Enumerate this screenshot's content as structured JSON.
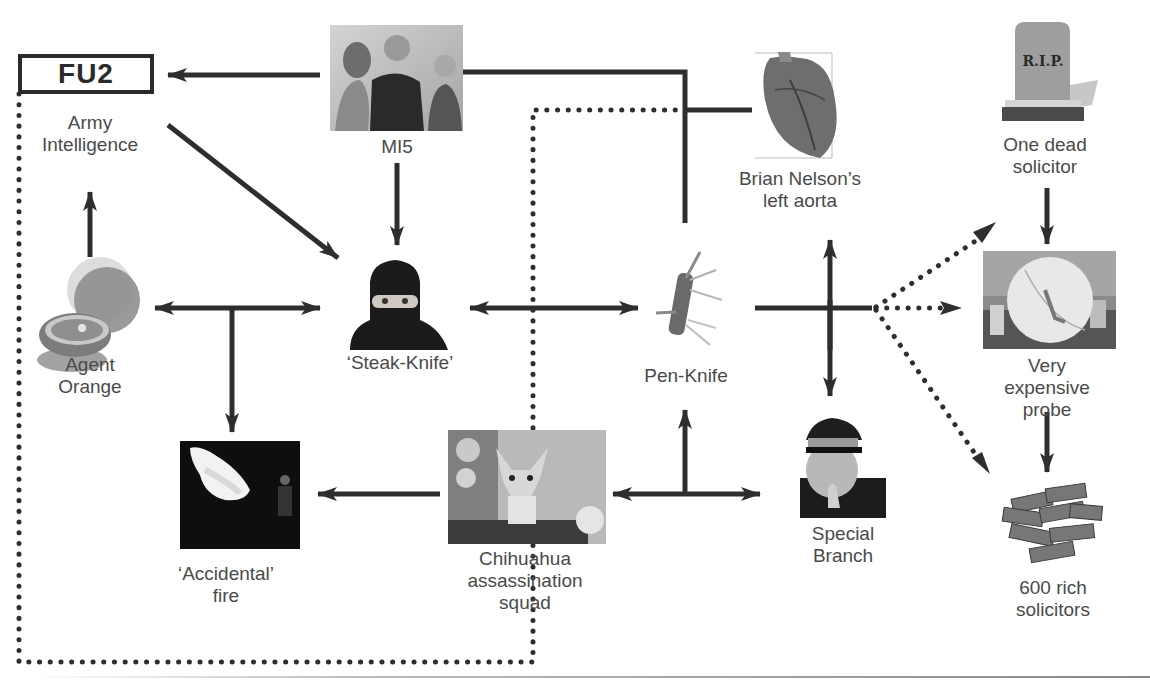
{
  "diagram": {
    "header_box": {
      "text": "FU2"
    },
    "nodes": [
      {
        "id": "fu2",
        "label": "Army\nIntelligence",
        "x": 90,
        "y": 112,
        "icon": "fu2-box"
      },
      {
        "id": "mi5",
        "label": "MI5",
        "x": 400,
        "y": 136,
        "icon": "photo-group-icon"
      },
      {
        "id": "aorta",
        "label": "Brian Nelson’s\nleft aorta",
        "x": 800,
        "y": 171,
        "icon": "heart-icon"
      },
      {
        "id": "dead",
        "label": "One dead\nsolicitor",
        "x": 1045,
        "y": 136,
        "icon": "gravestone-icon"
      },
      {
        "id": "orange",
        "label": "Agent\nOrange",
        "x": 90,
        "y": 356,
        "icon": "orange-icon"
      },
      {
        "id": "steak",
        "label": "‘Steak-Knife’",
        "x": 402,
        "y": 355,
        "icon": "balaclava-icon"
      },
      {
        "id": "pen",
        "label": "Pen-Knife",
        "x": 686,
        "y": 367,
        "icon": "pen-knife-icon"
      },
      {
        "id": "probe",
        "label": "Very expensive\nprobe",
        "x": 1047,
        "y": 356,
        "icon": "satellite-dish-icon"
      },
      {
        "id": "fire",
        "label": "‘Accidental’\nfire",
        "x": 226,
        "y": 565,
        "icon": "flame-icon"
      },
      {
        "id": "chihuahua",
        "label": "Chihuahua\nassassination\nsquad",
        "x": 513,
        "y": 547,
        "icon": "dog-icon"
      },
      {
        "id": "branch",
        "label": "Special\nBranch",
        "x": 843,
        "y": 525,
        "icon": "police-officer-icon"
      },
      {
        "id": "rich",
        "label": "600 rich\nsolicitors",
        "x": 1053,
        "y": 577,
        "icon": "cash-stack-icon"
      }
    ],
    "images": {
      "rip_text": "R.I.P."
    },
    "edges": [
      {
        "from": "mi5",
        "to": "fu2",
        "style": "solid",
        "arrow": "end"
      },
      {
        "from": "fu2",
        "to": "steak",
        "style": "solid",
        "arrow": "end"
      },
      {
        "from": "mi5",
        "to": "steak",
        "style": "solid",
        "arrow": "end"
      },
      {
        "from": "orange",
        "to": "fu2",
        "style": "solid",
        "arrow": "end"
      },
      {
        "from": "orange",
        "to": "steak",
        "style": "solid",
        "arrow": "both"
      },
      {
        "from": "orange-steak-junction",
        "to": "fire",
        "style": "solid",
        "arrow": "end"
      },
      {
        "from": "steak",
        "to": "pen",
        "style": "solid",
        "arrow": "both"
      },
      {
        "from": "mi5",
        "to": "pen",
        "style": "solid",
        "arrow": "none"
      },
      {
        "from": "aorta",
        "to": "mi5-pen-line",
        "style": "solid",
        "arrow": "none"
      },
      {
        "from": "branch-aorta-line",
        "to": "aorta",
        "style": "solid",
        "arrow": "end"
      },
      {
        "from": "pen",
        "to": "branch",
        "style": "solid",
        "arrow": "end"
      },
      {
        "from": "pen",
        "to": "dead",
        "style": "dotted",
        "arrow": "end"
      },
      {
        "from": "pen",
        "to": "probe",
        "style": "dotted",
        "arrow": "end"
      },
      {
        "from": "pen",
        "to": "rich",
        "style": "dotted",
        "arrow": "end"
      },
      {
        "from": "dead",
        "to": "probe",
        "style": "solid",
        "arrow": "end"
      },
      {
        "from": "probe",
        "to": "rich",
        "style": "solid",
        "arrow": "end"
      },
      {
        "from": "chihuahua",
        "to": "fire",
        "style": "solid",
        "arrow": "end"
      },
      {
        "from": "chihuahua",
        "to": "branch",
        "style": "solid",
        "arrow": "both"
      },
      {
        "from": "chihuahua-branch-junction",
        "to": "pen",
        "style": "solid",
        "arrow": "end"
      },
      {
        "from": "fu2",
        "to": "chihuahua",
        "style": "dotted",
        "arrow": "none"
      },
      {
        "from": "chihuahua",
        "to": "aorta-line",
        "style": "dotted",
        "arrow": "none"
      }
    ],
    "colors": {
      "line": "#2e2e2e",
      "text": "#4a4a4a"
    }
  }
}
